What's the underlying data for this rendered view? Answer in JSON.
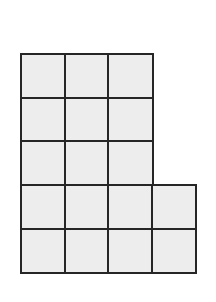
{
  "figure": {
    "type": "unit-square-grid",
    "colors": {
      "fill": "#ededed",
      "stroke": "#262626",
      "background": "#ffffff"
    },
    "origin": {
      "x": 20,
      "y": 53
    },
    "cell_size": 45,
    "rows": [
      {
        "row": 0,
        "columns": 3
      },
      {
        "row": 1,
        "columns": 3
      },
      {
        "row": 2,
        "columns": 3
      },
      {
        "row": 3,
        "columns": 4
      },
      {
        "row": 4,
        "columns": 4
      }
    ],
    "total_squares": 17
  }
}
